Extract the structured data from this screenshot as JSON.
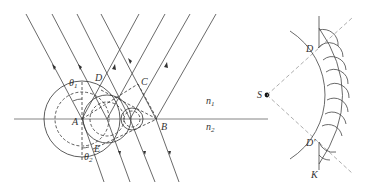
{
  "figure": {
    "type": "physics-diagram",
    "left_panel": {
      "labels": {
        "A": "A",
        "B": "B",
        "C": "C",
        "D": "D",
        "E": "E",
        "theta1": "θ",
        "theta1_sub": "1",
        "theta2": "θ",
        "theta2_sub": "2",
        "n1": "n",
        "n1_sub": "1",
        "n2": "n",
        "n2_sub": "2"
      }
    },
    "right_panel": {
      "labels": {
        "S": "S",
        "D": "D",
        "D_prime": "D'",
        "K": "K"
      }
    },
    "colors": {
      "line": "#333333",
      "axis": "#777777",
      "guide": "#999999",
      "background": "#ffffff"
    }
  }
}
